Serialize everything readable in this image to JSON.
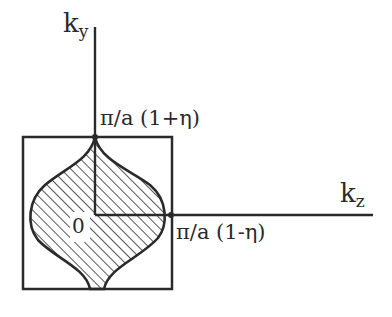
{
  "diagram": {
    "axes": {
      "vertical": {
        "label_main": "k",
        "label_sub": "y"
      },
      "horizontal": {
        "label_main": "k",
        "label_sub": "z"
      }
    },
    "labels": {
      "origin": "0",
      "ky_intercept": "π/a (1+η)",
      "kz_intercept": "π/a (1-η)"
    },
    "colors": {
      "ink": "#2a2a2a",
      "background": "#ffffff"
    }
  }
}
